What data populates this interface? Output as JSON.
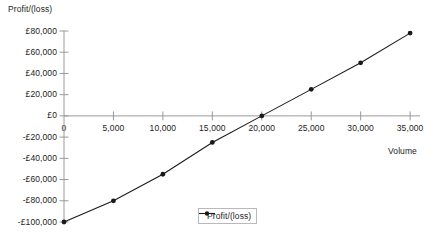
{
  "chart_data": {
    "type": "line",
    "title": "",
    "xlabel": "Volume",
    "ylabel": "Profit/(loss)",
    "x": [
      0,
      5000,
      10000,
      15000,
      20000,
      25000,
      30000,
      35000
    ],
    "series": [
      {
        "name": "Profit/(loss)",
        "values": [
          -100000,
          -80000,
          -55000,
          -25000,
          0,
          25000,
          50000,
          78000
        ],
        "marker": "filled-circle",
        "color": "#1a1a1a"
      }
    ],
    "x_tick_labels": [
      "0",
      "5,000",
      "10,000",
      "15,000",
      "20,000",
      "25,000",
      "30,000",
      "35,000"
    ],
    "x_tick_values": [
      0,
      5000,
      10000,
      15000,
      20000,
      25000,
      30000,
      35000
    ],
    "y_tick_labels": [
      "£80,000",
      "£60,000",
      "£40,000",
      "£20,000",
      "£0",
      "-£20,000",
      "-£40,000",
      "-£60,000",
      "-£80,000",
      "-£100,000"
    ],
    "y_tick_values": [
      80000,
      60000,
      40000,
      20000,
      0,
      -20000,
      -40000,
      -60000,
      -80000,
      -100000
    ],
    "xlim": [
      0,
      36000
    ],
    "ylim": [
      -100000,
      80000
    ],
    "grid": false,
    "legend": {
      "entries": [
        "Profit/(loss)"
      ],
      "position": "bottom-center",
      "border_color": "#b9b9b9"
    },
    "axis_color": "#9a9a9a",
    "breakeven_volume": 20000
  },
  "legend": {
    "label": "Profit/(loss)"
  },
  "axes": {
    "y_title": "Profit/(loss)",
    "x_title": "Volume"
  }
}
